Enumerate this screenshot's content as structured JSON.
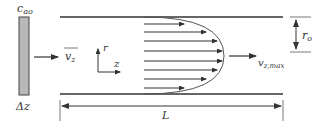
{
  "labels": {
    "concentration": "c",
    "concentration_sub": "ao",
    "slab_thickness": "Δz",
    "mean_velocity": "v",
    "mean_velocity_sub": "z",
    "axis_r": "r",
    "axis_z": "z",
    "max_velocity": "v",
    "max_velocity_sub": "z,max",
    "radius": "r",
    "radius_sub": "o",
    "length": "L"
  },
  "colors": {
    "line": "#333333",
    "slab_fill": "#b8b8b8"
  },
  "profile": {
    "arrow_count": 8,
    "shape": "parabolic"
  }
}
